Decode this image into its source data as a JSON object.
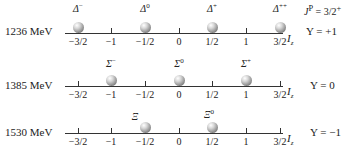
{
  "header": {
    "spin_parity": "J^P = 3/2^+"
  },
  "axis": {
    "label": "I",
    "label_sub": "z",
    "ticks": [
      "−3/2",
      "−1",
      "−1/2",
      "0",
      "1/2",
      "1",
      "3/2"
    ]
  },
  "rows": [
    {
      "mass": "1236 MeV",
      "hypercharge": "Y = +1",
      "particles": [
        {
          "symbol": "Δ",
          "charge": "−",
          "iz": "-3/2"
        },
        {
          "symbol": "Δ",
          "charge": "0",
          "iz": "-1/2"
        },
        {
          "symbol": "Δ",
          "charge": "+",
          "iz": "1/2"
        },
        {
          "symbol": "Δ",
          "charge": "++",
          "iz": "3/2"
        }
      ]
    },
    {
      "mass": "1385 MeV",
      "hypercharge": "Y = 0",
      "particles": [
        {
          "symbol": "Σ",
          "charge": "−",
          "iz": "-1"
        },
        {
          "symbol": "Σ",
          "charge": "0",
          "iz": "0"
        },
        {
          "symbol": "Σ",
          "charge": "+",
          "iz": "1"
        }
      ]
    },
    {
      "mass": "1530 MeV",
      "hypercharge": "Y = −1",
      "particles": [
        {
          "symbol": "Ξ",
          "charge": "",
          "iz": "-1/2"
        },
        {
          "symbol": "Ξ",
          "charge": "0",
          "iz": "1/2"
        }
      ]
    }
  ]
}
